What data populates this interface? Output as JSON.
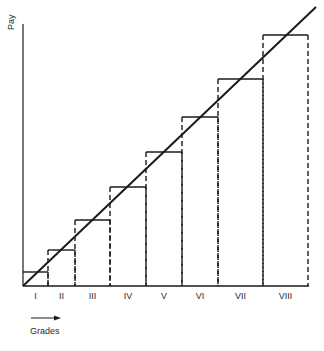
{
  "chart_data": {
    "type": "step-diagram",
    "title": "",
    "ylabel": "Pay",
    "xlabel": "Grades",
    "x_arrow": "right",
    "categories": [
      "I",
      "II",
      "III",
      "IV",
      "V",
      "VI",
      "VII",
      "VIII"
    ],
    "grade_boundaries_px": [
      23,
      48,
      75,
      110,
      146,
      182,
      218,
      263,
      308
    ],
    "step_top_px": [
      272,
      250,
      220,
      187,
      152,
      117,
      79,
      35
    ],
    "baseline_px": 286,
    "trend_line": {
      "from": [
        23,
        286
      ],
      "to": [
        316,
        7
      ]
    },
    "relative_pay_levels": [
      1,
      2.5,
      4.5,
      6.7,
      9.1,
      11.5,
      14.1,
      17.1
    ]
  },
  "labels": {
    "pay": "Pay",
    "grades": "Grades",
    "grade_names": [
      "I",
      "II",
      "III",
      "IV",
      "V",
      "VI",
      "VII",
      "VIII"
    ]
  },
  "colors": {
    "line": "#1a1a1a",
    "text": "#2a2a2a",
    "background": "#ffffff"
  }
}
